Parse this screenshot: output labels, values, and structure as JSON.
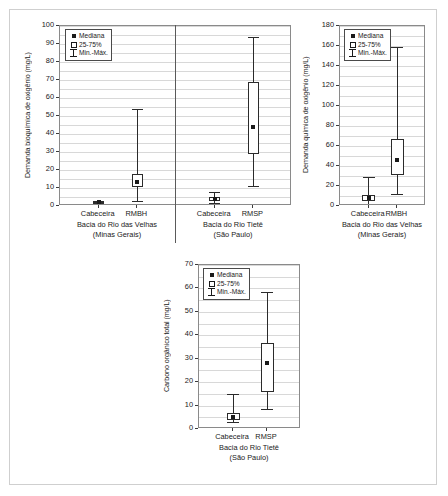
{
  "figure": {
    "legend_labels": {
      "median": "Mediana",
      "iqr": "25-75%",
      "minmax": "Min.-Máx."
    }
  },
  "chart_data": [
    {
      "id": "dbo",
      "type": "box",
      "title": "",
      "ylabel": "Demanda bioquímica de oxigênio (mg/L)",
      "xlabel": "",
      "ylim": [
        0,
        100
      ],
      "yticks": [
        0,
        10,
        20,
        30,
        40,
        50,
        60,
        70,
        80,
        90,
        100
      ],
      "ytick_labels": [
        "0",
        "10",
        "20",
        "30",
        "40",
        "50",
        "60",
        "70",
        "80",
        "90",
        "100"
      ],
      "grid": true,
      "legend_position": "top-left",
      "groups": [
        {
          "caption_line1": "Bacia do Rio das Velhas",
          "caption_line2": "(Minas Gerais)",
          "categories": [
            "Cabeceira",
            "RMBH"
          ]
        },
        {
          "caption_line1": "Bacia do Rio Tietê",
          "caption_line2": "(São Paulo)",
          "categories": [
            "Cabeceira",
            "RMSP"
          ]
        }
      ],
      "boxes": [
        {
          "label": "Cabeceira",
          "group": 0,
          "min": 1.2,
          "q1": 1.6,
          "median": 2.0,
          "q3": 2.4,
          "max": 2.8
        },
        {
          "label": "RMBH",
          "group": 0,
          "min": 3.0,
          "q1": 10.5,
          "median": 13.5,
          "q3": 18.0,
          "max": 54.0
        },
        {
          "label": "Cabeceira",
          "group": 1,
          "min": 1.5,
          "q1": 3.0,
          "median": 4.0,
          "q3": 5.0,
          "max": 8.0
        },
        {
          "label": "RMSP",
          "group": 1,
          "min": 11.0,
          "q1": 29.0,
          "median": 44.0,
          "q3": 69.0,
          "max": 94.0
        }
      ]
    },
    {
      "id": "dqo",
      "type": "box",
      "title": "",
      "ylabel": "Demanda química de oxigênio (mg/L)",
      "xlabel": "",
      "ylim": [
        0,
        180
      ],
      "yticks": [
        0,
        20,
        40,
        60,
        80,
        100,
        120,
        140,
        160,
        180
      ],
      "ytick_labels": [
        "0",
        "20",
        "40",
        "60",
        "80",
        "100",
        "120",
        "140",
        "160",
        "180"
      ],
      "grid": true,
      "legend_position": "top-left",
      "groups": [
        {
          "caption_line1": "Bacia do Rio das Velhas",
          "caption_line2": "(Minas Gerais)",
          "categories": [
            "Cabeceira",
            "RMBH"
          ]
        }
      ],
      "boxes": [
        {
          "label": "Cabeceira",
          "group": 0,
          "min": 2.0,
          "q1": 5.0,
          "median": 8.0,
          "q3": 11.0,
          "max": 29.0
        },
        {
          "label": "RMBH",
          "group": 0,
          "min": 12.0,
          "q1": 31.0,
          "median": 46.0,
          "q3": 67.0,
          "max": 159.0
        }
      ]
    },
    {
      "id": "cot",
      "type": "box",
      "title": "",
      "ylabel": "Carbono orgânico total (mg/L)",
      "xlabel": "",
      "ylim": [
        0,
        70
      ],
      "yticks": [
        0,
        10,
        20,
        30,
        40,
        50,
        60,
        70
      ],
      "ytick_labels": [
        "0",
        "10",
        "20",
        "30",
        "40",
        "50",
        "60",
        "70"
      ],
      "grid": true,
      "legend_position": "top-left",
      "groups": [
        {
          "caption_line1": "Bacia do Rio Tietê",
          "caption_line2": "(São Paulo)",
          "categories": [
            "Cabeceira",
            "RMSP"
          ]
        }
      ],
      "boxes": [
        {
          "label": "Cabeceira",
          "group": 0,
          "min": 3.0,
          "q1": 4.0,
          "median": 5.2,
          "q3": 6.8,
          "max": 14.8
        },
        {
          "label": "RMSP",
          "group": 0,
          "min": 8.5,
          "q1": 16.0,
          "median": 28.0,
          "q3": 36.8,
          "max": 58.5
        }
      ]
    }
  ]
}
